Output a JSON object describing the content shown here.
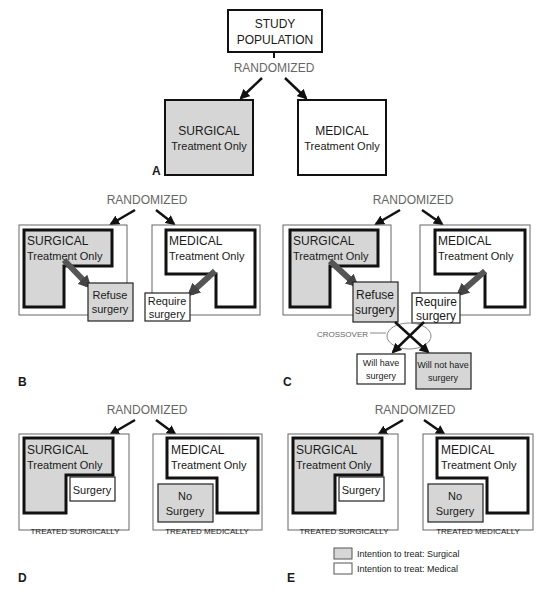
{
  "colors": {
    "surgical_fill": "#d6d6d6",
    "medical_fill": "#ffffff",
    "outline": "#111111",
    "randomized_text": "#666666"
  },
  "panelA": {
    "label": "A",
    "study_population_line1": "STUDY",
    "study_population_line2": "POPULATION",
    "randomized": "RANDOMIZED",
    "surgical_line1": "SURGICAL",
    "surgical_line2": "Treatment Only",
    "medical_line1": "MEDICAL",
    "medical_line2": "Treatment Only"
  },
  "panelB": {
    "label": "B",
    "randomized": "RANDOMIZED",
    "surgical_line1": "SURGICAL",
    "surgical_line2": "Treatment Only",
    "medical_line1": "MEDICAL",
    "medical_line2": "Treatment Only",
    "refuse_line1": "Refuse",
    "refuse_line2": "surgery",
    "require_line1": "Require",
    "require_line2": "surgery"
  },
  "panelC": {
    "label": "C",
    "randomized": "RANDOMIZED",
    "surgical_line1": "SURGICAL",
    "surgical_line2": "Treatment Only",
    "medical_line1": "MEDICAL",
    "medical_line2": "Treatment Only",
    "refuse_line1": "Refuse",
    "refuse_line2": "surgery",
    "require_line1": "Require",
    "require_line2": "surgery",
    "crossover": "CROSSOVER",
    "will_have_line1": "Will have",
    "will_have_line2": "surgery",
    "will_not_have_line1": "Will not have",
    "will_not_have_line2": "surgery"
  },
  "panelD": {
    "label": "D",
    "randomized": "RANDOMIZED",
    "surgical_line1": "SURGICAL",
    "surgical_line2": "Treatment Only",
    "medical_line1": "MEDICAL",
    "medical_line2": "Treatment Only",
    "surgery": "Surgery",
    "no_surgery_line1": "No",
    "no_surgery_line2": "Surgery",
    "treated_surgically": "TREATED SURGICALLY",
    "treated_medically": "TREATED MEDICALLY"
  },
  "panelE": {
    "label": "E",
    "randomized": "RANDOMIZED",
    "surgical_line1": "SURGICAL",
    "surgical_line2": "Treatment Only",
    "medical_line1": "MEDICAL",
    "medical_line2": "Treatment Only",
    "surgery": "Surgery",
    "no_surgery_line1": "No",
    "no_surgery_line2": "Surgery",
    "treated_surgically": "TREATED SURGICALLY",
    "treated_medically": "TREATED MEDICALLY"
  },
  "legend": {
    "items": [
      {
        "label": "Intention to treat: Surgical",
        "color": "#d6d6d6"
      },
      {
        "label": "Intention to treat: Medical",
        "color": "#ffffff"
      }
    ]
  }
}
